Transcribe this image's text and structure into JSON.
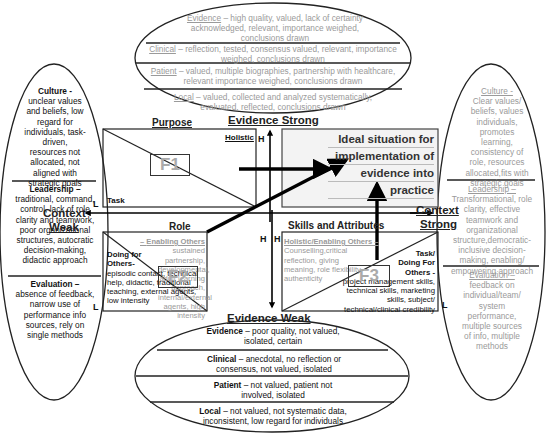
{
  "top_ellipse": {
    "evidence": {
      "label": "Evidence",
      "text": " – high quality, valued, lack of certainty acknowledged, relevant, importance weighed, conclusions drawn"
    },
    "clinical": {
      "label": "Clinical",
      "text": " – reflection, tested, consensus valued, relevant, importance weighed, conclusions drawn"
    },
    "patient": {
      "label": "Patient",
      "text": " – valued, multiple biographies, partnership with healthcare, relevant importance weighed, conclusions drawn"
    },
    "local": {
      "label": "Local",
      "text": " – valued, collected and analyzed systematically, evaluated, reflected, conclusions drawn"
    }
  },
  "bottom_ellipse": {
    "evidence": {
      "label": "Evidence",
      "text": " – poor quality, not valued, isolated, certain"
    },
    "clinical": {
      "label": "Clinical",
      "text": " – anecdotal, no reflection or consensus, not valued, isolated"
    },
    "patient": {
      "label": "Patient",
      "text": " – not valued, patient not involved, isolated"
    },
    "local": {
      "label": "Local",
      "text": " – not valued, not systematic data, inconsistent, low regard for individuals"
    }
  },
  "left_ellipse": {
    "culture": {
      "label": "Culture -",
      "text": "unclear values and beliefs, low regard for individuals, task-driven, resources not allocated, not aligned with strategic goals"
    },
    "leadership": {
      "label": "Leadership –",
      "text": "traditional, command, control, lack of role clarity and teamwork, poor organizational structures, autocratic decision-making, didactic approach"
    },
    "evaluation": {
      "label": "Evaluation –",
      "text": "absence of feedback, narrow use of performance info sources, rely on single methods"
    }
  },
  "right_ellipse": {
    "culture": {
      "label": "Culture -",
      "text": "Clear values/ beliefs, values individuals, promotes learning, consistency of role, resources allocated,fits with strategic goals"
    },
    "leadership": {
      "label": "Leadership –",
      "text": "Transformational, role clarity, effective teamwork and organizational structure,democratic-inclusive decision-making, enabling/ empowering approach"
    },
    "evaluation": {
      "label": "Evaluation –",
      "text": "feedback on individual/team/ system performance, multiple sources of info, multiple methods"
    }
  },
  "axes": {
    "evidence_strong": "Evidence Strong",
    "evidence_weak": "Evidence Weak",
    "context_weak_1": "Context",
    "context_weak_2": "Weak",
    "context_strong_1": "Context",
    "context_strong_2": "Strong"
  },
  "f1": {
    "title": "Purpose",
    "holistic": "Holistic",
    "task": "Task",
    "box": "F1",
    "h": "H",
    "l": "L"
  },
  "f2": {
    "title": "Role",
    "enabling_label": "Enabling Others –",
    "enabling_text": "sustained partnership, developmental, adult learning approach, internal/external agents, high intensity",
    "doing_label": "Doing for Others-",
    "doing_text": "episodic contact, technical help, didactic, traditional teaching, external agents, low intensity",
    "box": "F2",
    "h": "H",
    "l": "L"
  },
  "f3": {
    "title": "Skills and Attributes",
    "holistic_label": "Holistic/Enabling Others –",
    "holistic_text": "Counselling,critical reflection, giving meaning, role flexibility, authenticity",
    "task_label": "Task/ Doing For Others -",
    "task_text": "project management skills, technical skills, marketing skills, subject/ technical/clinical credibility",
    "box": "F3",
    "h": "H",
    "l": "L"
  },
  "ideal": {
    "lines": [
      "Ideal situation for",
      "implementation of",
      "evidence into",
      "practice"
    ]
  },
  "colors": {
    "ink": "#111111",
    "faded_text": "#9a9a9a",
    "ideal_fill": "#f3f3f3"
  }
}
